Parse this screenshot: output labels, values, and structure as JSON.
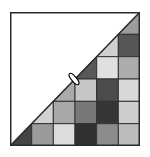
{
  "puzzle": {
    "rows": 6,
    "cols": 6,
    "frame_color": "#2a2a2a",
    "grid_line_color": "#333333",
    "background_color": "#ffffff",
    "cells": [
      [
        null,
        null,
        null,
        null,
        null,
        "#9c9c9c"
      ],
      [
        null,
        null,
        null,
        null,
        "#d0d0d0",
        "#565656"
      ],
      [
        null,
        null,
        null,
        "#585858",
        "#e0e0e0",
        "#acacac"
      ],
      [
        null,
        null,
        "#ababab",
        "#c6c6c6",
        "#4c4c4c",
        "#d8d8d8"
      ],
      [
        null,
        "#d2d2d2",
        "#a8a8a8",
        "#787878",
        "#353535",
        "#cdcdcd"
      ],
      [
        "#454545",
        "#9a9a9a",
        "#dcdcdc",
        "#2f2f2f",
        "#8c8c8c",
        "#bcbcbc"
      ]
    ],
    "diagonal_cells": [
      [
        0,
        5
      ],
      [
        1,
        4
      ],
      [
        2,
        3
      ],
      [
        3,
        2
      ],
      [
        4,
        1
      ],
      [
        5,
        0
      ]
    ],
    "marker": {
      "type": "ellipse",
      "cx": 74,
      "cy": 79,
      "fill": "#ffffff",
      "stroke": "#000000"
    }
  }
}
